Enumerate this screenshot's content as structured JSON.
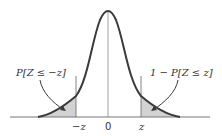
{
  "diagram": {
    "labels": {
      "left_tail": "P[Z ≤ −z]",
      "right_tail": "1 − P[Z ≤ z]"
    },
    "ticks": {
      "neg_z": "−z",
      "zero": "0",
      "pos_z": "z"
    },
    "colors": {
      "curve": "#3a3a3a",
      "shade": "#d2d2d2",
      "axis": "#777777",
      "center_line": "#888888",
      "text": "#333333"
    }
  }
}
